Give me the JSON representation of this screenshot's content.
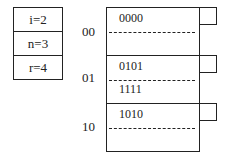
{
  "params": [
    {
      "label": "i=2"
    },
    {
      "label": "n=3"
    },
    {
      "label": "r=4"
    }
  ],
  "buckets": [
    {
      "label": "00",
      "records": [
        "0000"
      ]
    },
    {
      "label": "01",
      "records": [
        "0101",
        "1111"
      ]
    },
    {
      "label": "10",
      "records": [
        "1010"
      ]
    }
  ]
}
